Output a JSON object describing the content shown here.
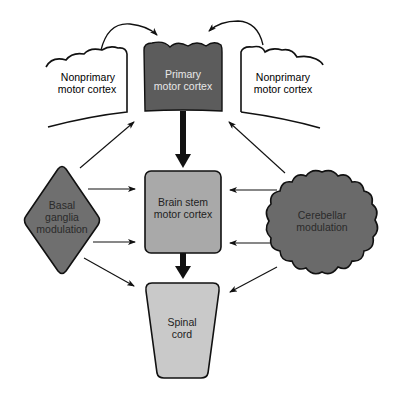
{
  "diagram": {
    "type": "flowchart",
    "nodes": [
      {
        "id": "nonprimary_left",
        "line1": "Nonprimary",
        "line2": "motor cortex",
        "fill": "#ffffff",
        "text_color": "#222222"
      },
      {
        "id": "primary",
        "line1": "Primary",
        "line2": "motor cortex",
        "fill": "#5c5c5c",
        "text_color": "#e8e8e8"
      },
      {
        "id": "nonprimary_right",
        "line1": "Nonprimary",
        "line2": "motor cortex",
        "fill": "#ffffff",
        "text_color": "#222222"
      },
      {
        "id": "brain_stem",
        "line1": "Brain stem",
        "line2": "motor cortex",
        "fill": "#a9a9a9",
        "text_color": "#222222"
      },
      {
        "id": "basal_ganglia",
        "line1": "Basal",
        "line2": "ganglia",
        "line3": "modulation",
        "fill": "#6f6f6f",
        "text_color": "#2a2a2a"
      },
      {
        "id": "cerebellar",
        "line1": "Cerebellar",
        "line2": "modulation",
        "fill": "#6a6a6a",
        "text_color": "#2a2a2a"
      },
      {
        "id": "spinal_cord",
        "line1": "Spinal",
        "line2": "cord",
        "fill": "#c9c9c9",
        "text_color": "#222222"
      }
    ],
    "edges": [
      {
        "from": "nonprimary_left",
        "to": "primary",
        "style": "curved"
      },
      {
        "from": "nonprimary_right",
        "to": "primary",
        "style": "curved"
      },
      {
        "from": "primary",
        "to": "brain_stem",
        "style": "thick"
      },
      {
        "from": "brain_stem",
        "to": "spinal_cord",
        "style": "thick"
      },
      {
        "from": "basal_ganglia",
        "to": "primary",
        "style": "thin"
      },
      {
        "from": "basal_ganglia",
        "to": "brain_stem",
        "style": "thin",
        "count": 2
      },
      {
        "from": "basal_ganglia",
        "to": "spinal_cord",
        "style": "thin"
      },
      {
        "from": "cerebellar",
        "to": "primary",
        "style": "thin"
      },
      {
        "from": "cerebellar",
        "to": "brain_stem",
        "style": "thin",
        "count": 2
      },
      {
        "from": "cerebellar",
        "to": "spinal_cord",
        "style": "thin"
      }
    ]
  }
}
